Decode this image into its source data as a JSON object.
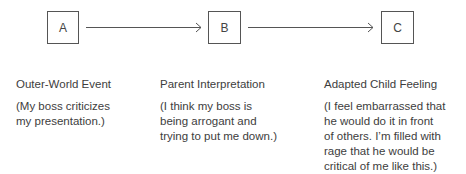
{
  "nodes": [
    {
      "label": "A",
      "title": "Outer-World Event",
      "description": "(My boss criticizes\nmy presentation.)"
    },
    {
      "label": "B",
      "title": "Parent Interpretation",
      "description": "(I think my boss is\nbeing arrogant and\ntrying to put me down.)"
    },
    {
      "label": "C",
      "title": "Adapted Child Feeling",
      "description": "(I feel embarrassed that\nhe would do it in front\nof others. I’m filled with\nrage that he would be\ncritical of me like this.)"
    }
  ],
  "edges": [
    {
      "from": "A",
      "to": "B"
    },
    {
      "from": "B",
      "to": "C"
    }
  ],
  "colors": {
    "line": "#555555",
    "text": "#3d3d3d"
  }
}
